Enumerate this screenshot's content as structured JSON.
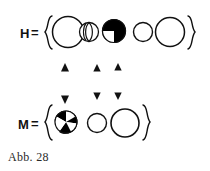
{
  "figure": {
    "caption": "Abb. 28",
    "ink_color": "#111111",
    "fill_black": "#000000",
    "fill_white": "#ffffff",
    "background": "#ffffff",
    "rows": [
      {
        "label": "H =",
        "label_text": "H",
        "equals": "=",
        "open_brace": "{",
        "close_brace": "}",
        "elements": [
          {
            "name": "circle-large-open",
            "kind": "open-circle",
            "radius": 16
          },
          {
            "name": "circle-segmented-lens",
            "kind": "lens-segmented-circle",
            "radius": 10
          },
          {
            "name": "circle-quadrant-checker",
            "kind": "quadrant-checker-circle",
            "radius": 12
          },
          {
            "name": "circle-small-open",
            "kind": "open-circle",
            "radius": 10
          },
          {
            "name": "circle-large-open-2",
            "kind": "open-circle",
            "radius": 15
          }
        ]
      },
      {
        "label": "M =",
        "label_text": "M",
        "equals": "=",
        "open_brace": "{",
        "close_brace": "}",
        "elements": [
          {
            "name": "circle-pinwheel",
            "kind": "pinwheel-circle",
            "radius": 11
          },
          {
            "name": "circle-small-open",
            "kind": "open-circle",
            "radius": 10
          },
          {
            "name": "circle-large-open",
            "kind": "open-circle",
            "radius": 14
          }
        ]
      }
    ],
    "arrows": {
      "name": "double-headed-vertical-arrow",
      "count": 3,
      "direction": "bidirectional-vertical"
    }
  }
}
